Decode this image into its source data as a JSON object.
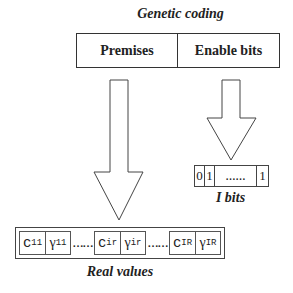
{
  "diagram": {
    "title": "Genetic coding",
    "header": {
      "left_label": "Premises",
      "right_label": "Enable bits"
    },
    "arrows": [
      {
        "from": "Premises",
        "to": "Real values"
      },
      {
        "from": "Enable bits",
        "to": "I bits"
      }
    ],
    "bits": {
      "cells": [
        "0",
        "1",
        "……",
        "1"
      ],
      "caption": "I bits"
    },
    "real_values": {
      "groups": [
        {
          "c": "c",
          "c_sub": "11",
          "g": "γ",
          "g_sub": "11"
        },
        {
          "c": "c",
          "c_sub": "ir",
          "g": "γ",
          "g_sub": "ir"
        },
        {
          "c": "c",
          "c_sub": "IR",
          "g": "γ",
          "g_sub": "IR"
        }
      ],
      "separator": "……",
      "caption": "Real values"
    },
    "colors": {
      "stroke": "#333333",
      "background": "#ffffff"
    }
  }
}
